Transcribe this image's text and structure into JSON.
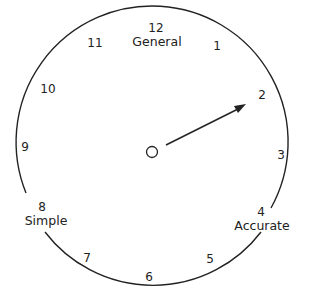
{
  "diagram": {
    "type": "clock-dial",
    "hour_labels": [
      {
        "n": "12",
        "x": 156,
        "y": 28
      },
      {
        "n": "1",
        "x": 217,
        "y": 46
      },
      {
        "n": "2",
        "x": 262,
        "y": 95
      },
      {
        "n": "3",
        "x": 281,
        "y": 155
      },
      {
        "n": "4",
        "x": 263,
        "y": 212
      },
      {
        "n": "5",
        "x": 210,
        "y": 259
      },
      {
        "n": "6",
        "x": 149,
        "y": 277
      },
      {
        "n": "7",
        "x": 87,
        "y": 258
      },
      {
        "n": "8",
        "x": 41,
        "y": 207
      },
      {
        "n": "9",
        "x": 24,
        "y": 147
      },
      {
        "n": "10",
        "x": 48,
        "y": 89
      },
      {
        "n": "11",
        "x": 95,
        "y": 43
      }
    ],
    "word_labels": {
      "general": "General",
      "simple": "Simple",
      "accurate": "Accurate"
    },
    "pointer": {
      "from": "center",
      "to_hour": "2"
    },
    "colors": {
      "stroke": "#222222",
      "background": "#ffffff"
    }
  }
}
